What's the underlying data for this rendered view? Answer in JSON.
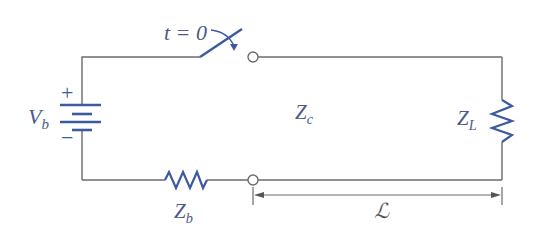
{
  "diagram": {
    "type": "circuit",
    "colors": {
      "wire": "#6b6b6b",
      "component": "#3d5a9e",
      "label": "#4a5a8c"
    },
    "labels": {
      "switch": "t = 0",
      "source_voltage": {
        "main": "V",
        "sub": "b"
      },
      "source_plus": "+",
      "source_minus": "−",
      "source_impedance": {
        "main": "Z",
        "sub": "b"
      },
      "line_impedance": {
        "main": "Z",
        "sub": "c"
      },
      "load_impedance": {
        "main": "Z",
        "sub": "L"
      },
      "line_length": "ℒ"
    },
    "components": [
      {
        "id": "battery",
        "kind": "dc-source",
        "label": "V_b"
      },
      {
        "id": "switch",
        "kind": "switch",
        "label": "t = 0"
      },
      {
        "id": "source-resistor",
        "kind": "resistor",
        "label": "Z_b"
      },
      {
        "id": "transmission-line",
        "kind": "line",
        "label": "Z_c",
        "length": "ℒ"
      },
      {
        "id": "load-resistor",
        "kind": "resistor",
        "label": "Z_L"
      }
    ]
  }
}
